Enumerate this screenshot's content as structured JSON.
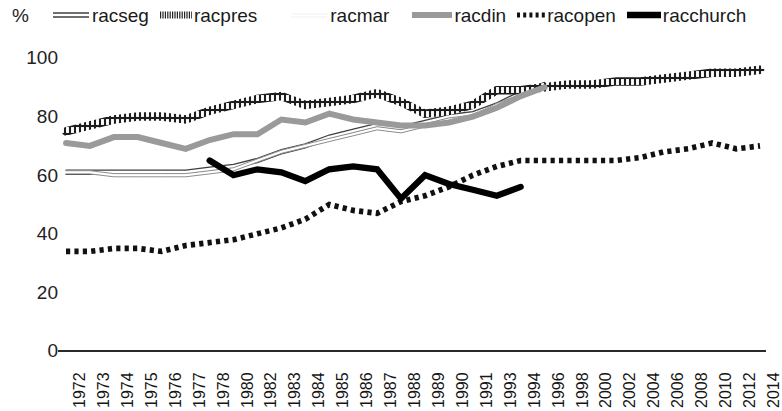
{
  "axis_unit": "%",
  "legend": [
    {
      "label": "racseg",
      "style": "double-line",
      "color": "#3f3f3f"
    },
    {
      "label": "racpres",
      "style": "hatched",
      "color": "#222222"
    },
    {
      "label": "racmar",
      "style": "faint-line",
      "color": "#e2e2e2"
    },
    {
      "label": "racdin",
      "style": "thick-gray",
      "color": "#9a9a9a"
    },
    {
      "label": "racopen",
      "style": "square-dot",
      "color": "#111111"
    },
    {
      "label": "racchurch",
      "style": "thick-solid",
      "color": "#000000"
    }
  ],
  "chart_data": {
    "type": "line",
    "title": "",
    "xlabel": "",
    "ylabel": "%",
    "ylim": [
      0,
      100
    ],
    "yticks": [
      0,
      20,
      40,
      60,
      80,
      100
    ],
    "grid": false,
    "legend_position": "top",
    "categories": [
      "1972",
      "1973",
      "1974",
      "1975",
      "1976",
      "1977",
      "1978",
      "1980",
      "1982",
      "1983",
      "1984",
      "1985",
      "1986",
      "1987",
      "1988",
      "1989",
      "1990",
      "1991",
      "1993",
      "1994",
      "1996",
      "1998",
      "2000",
      "2002",
      "2004",
      "2006",
      "2008",
      "2010",
      "2012",
      "2014"
    ],
    "series": [
      {
        "name": "racseg",
        "style": "double-line",
        "color": "#3f3f3f",
        "values": [
          61,
          61,
          61,
          61,
          61,
          61,
          62,
          63,
          65,
          68,
          70,
          73,
          75,
          77,
          76,
          78,
          80,
          81,
          84,
          88,
          91,
          null,
          null,
          null,
          null,
          null,
          null,
          null,
          null,
          null
        ]
      },
      {
        "name": "racpres",
        "style": "hatched",
        "color": "#222222",
        "values": [
          75,
          77,
          79,
          80,
          80,
          79,
          82,
          84,
          86,
          87,
          84,
          85,
          86,
          88,
          85,
          81,
          82,
          84,
          89,
          89,
          90,
          91,
          91,
          92,
          92,
          93,
          94,
          95,
          95,
          96
        ]
      },
      {
        "name": "racmar",
        "style": "faint-line",
        "color": "#d8d8d8",
        "values": [
          61,
          61,
          60,
          60,
          60,
          60,
          61,
          62,
          65,
          68,
          70,
          72,
          74,
          76,
          75,
          77,
          79,
          80,
          84,
          87,
          90,
          null,
          null,
          null,
          null,
          null,
          null,
          null,
          null,
          null
        ]
      },
      {
        "name": "racdin",
        "style": "thick-gray",
        "color": "#9a9a9a",
        "values": [
          71,
          70,
          73,
          73,
          71,
          69,
          72,
          74,
          74,
          79,
          78,
          81,
          79,
          78,
          77,
          77,
          78,
          80,
          83,
          87,
          90,
          null,
          null,
          null,
          null,
          null,
          null,
          null,
          null,
          null
        ]
      },
      {
        "name": "racopen",
        "style": "square-dot",
        "color": "#111111",
        "values": [
          34,
          34,
          35,
          35,
          34,
          36,
          37,
          38,
          40,
          42,
          45,
          50,
          48,
          47,
          51,
          53,
          56,
          60,
          63,
          65,
          65,
          65,
          65,
          65,
          66,
          68,
          69,
          71,
          69,
          70
        ]
      },
      {
        "name": "racchurch",
        "style": "thick-solid",
        "color": "#000000",
        "values": [
          null,
          null,
          null,
          null,
          null,
          null,
          65,
          60,
          62,
          61,
          58,
          62,
          63,
          62,
          52,
          60,
          57,
          55,
          53,
          56,
          null,
          null,
          null,
          null,
          null,
          null,
          null,
          null,
          null,
          null
        ]
      }
    ]
  }
}
